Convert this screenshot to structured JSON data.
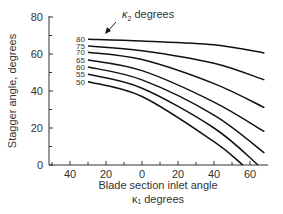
{
  "chart_data": {
    "type": "line",
    "title": "",
    "xlabel": "Blade section inlet angle",
    "xlabel_line2": "κ₁ degrees",
    "ylabel": "Stagger angle, degrees",
    "xlim": [
      -52,
      69
    ],
    "ylim": [
      0,
      80
    ],
    "x_ticks": [
      -40,
      -20,
      0,
      20,
      40,
      60
    ],
    "x_tick_labels": [
      "40",
      "20",
      "0",
      "20",
      "40",
      "60"
    ],
    "y_ticks": [
      0,
      20,
      40,
      60,
      80
    ],
    "y_tick_labels": [
      "0",
      "20",
      "40",
      "60",
      "80"
    ],
    "grid": false,
    "legend": "none",
    "annotation": {
      "text_symbol": "κ",
      "text_sub": "2",
      "text_rest": " degrees"
    },
    "series": [
      {
        "name": "80",
        "x": [
          -30,
          0,
          40,
          68
        ],
        "values": [
          68,
          67,
          65,
          60.5
        ]
      },
      {
        "name": "75",
        "x": [
          -30,
          0,
          40,
          68
        ],
        "values": [
          64.3,
          61.8,
          55,
          46
        ]
      },
      {
        "name": "70",
        "x": [
          -30,
          0,
          40,
          68
        ],
        "values": [
          61,
          57,
          44,
          31
        ]
      },
      {
        "name": "65",
        "x": [
          -30,
          0,
          40,
          68
        ],
        "values": [
          56.8,
          51,
          34,
          18
        ]
      },
      {
        "name": "60",
        "x": [
          -30,
          0,
          40,
          68
        ],
        "values": [
          53,
          46,
          27,
          6.5
        ]
      },
      {
        "name": "55",
        "x": [
          -30,
          0,
          40,
          64.5
        ],
        "values": [
          49,
          41.5,
          20,
          0
        ]
      },
      {
        "name": "50",
        "x": [
          -30,
          0,
          40,
          56
        ],
        "values": [
          45,
          37,
          12.6,
          0
        ]
      }
    ]
  }
}
